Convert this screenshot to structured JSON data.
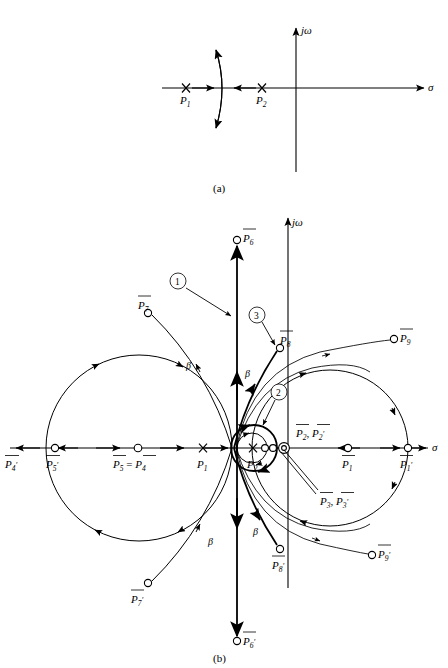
{
  "figure": {
    "panels": [
      {
        "id": "a",
        "caption": "(a)"
      },
      {
        "id": "b",
        "caption": "(b)"
      }
    ]
  },
  "axes": {
    "imaginary_label": "jω",
    "real_label": "σ"
  },
  "panel_a": {
    "caption": "(a)",
    "poles": [
      {
        "name": "P1",
        "label": "P",
        "subscript": "1",
        "marker": "cross",
        "x": -2.0
      },
      {
        "name": "P2",
        "label": "P",
        "subscript": "2",
        "marker": "cross",
        "x": -0.75
      }
    ],
    "breakaway_arc": {
      "description": "vertical breakaway arc between P1 and P2"
    },
    "axis_arrow_directions": [
      "right-toward-breakaway",
      "left-toward-breakaway"
    ]
  },
  "panel_b": {
    "caption": "(b)",
    "annotations": [
      {
        "id": "1",
        "label": "1",
        "points_to": "vertical-asymptote-branch"
      },
      {
        "id": "2",
        "label": "2",
        "points_to": "small-circle-near-origin"
      },
      {
        "id": "3",
        "label": "3",
        "points_to": "branch-to-P8bar"
      }
    ],
    "angle_labels": [
      {
        "label": "β",
        "position": "upper-left"
      },
      {
        "label": "β",
        "position": "upper-right"
      },
      {
        "label": "β",
        "position": "lower-left"
      },
      {
        "label": "β",
        "position": "lower-right"
      }
    ],
    "real_axis_poles": [
      {
        "name": "P1",
        "label": "P",
        "subscript": "1",
        "marker": "cross",
        "bar": false,
        "prime": false
      },
      {
        "name": "P2",
        "label": "P",
        "subscript": "2",
        "marker": "cross",
        "bar": false,
        "prime": false
      }
    ],
    "zeros": [
      {
        "name": "P4bar-prime",
        "label": "P",
        "subscript": "4",
        "bar": true,
        "prime": true,
        "location": "far-left-arrow"
      },
      {
        "name": "P5bar-prime",
        "label": "P",
        "subscript": "5",
        "bar": true,
        "prime": true,
        "location": "left-real-axis"
      },
      {
        "name": "P5bar-eq-P4bar",
        "label": "P₅ = P₄",
        "subscript": "",
        "bar": true,
        "prime": false,
        "location": "left-real-axis-mid",
        "text": "P5 = P4"
      },
      {
        "name": "P6bar",
        "label": "P",
        "subscript": "6",
        "bar": true,
        "prime": false,
        "location": "top-vertical"
      },
      {
        "name": "P6bar-prime",
        "label": "P",
        "subscript": "6",
        "bar": true,
        "prime": true,
        "location": "bottom-vertical"
      },
      {
        "name": "P7bar",
        "label": "P",
        "subscript": "7",
        "bar": true,
        "prime": false,
        "location": "upper-left"
      },
      {
        "name": "P7bar-prime",
        "label": "P",
        "subscript": "7",
        "bar": true,
        "prime": true,
        "location": "lower-left"
      },
      {
        "name": "P8bar",
        "label": "P",
        "subscript": "8",
        "bar": true,
        "prime": false,
        "location": "upper-center-right"
      },
      {
        "name": "P8bar-prime",
        "label": "P",
        "subscript": "8",
        "bar": true,
        "prime": true,
        "location": "lower-center-right"
      },
      {
        "name": "P9bar",
        "label": "P",
        "subscript": "9",
        "bar": true,
        "prime": false,
        "location": "upper-right"
      },
      {
        "name": "P9bar-prime",
        "label": "P",
        "subscript": "9",
        "bar": true,
        "prime": true,
        "location": "lower-right"
      },
      {
        "name": "P1bar",
        "label": "P",
        "subscript": "1",
        "bar": true,
        "prime": false,
        "location": "right-real-axis"
      },
      {
        "name": "P1bar-prime",
        "label": "P",
        "subscript": "1",
        "bar": true,
        "prime": true,
        "location": "far-right-real-axis"
      },
      {
        "name": "P2bar-P2bar-prime",
        "text": "P2 , P2'",
        "bar": true,
        "location": "double-zero-near-origin"
      },
      {
        "name": "P3bar-P3bar-prime",
        "text": "P3 , P3'",
        "bar": true,
        "location": "double-zero-near-origin-lower-lead"
      }
    ],
    "labels_text": {
      "p4_prime": "P",
      "p5_prime": "P",
      "p5_eq_p4_left": "P",
      "p5_eq_p4_eq": " = ",
      "p5_eq_p4_right": "P",
      "p1": "P",
      "p2": "P",
      "p1_bar": "P",
      "p1_bar_prime": "P",
      "p2_pair": "P",
      "p3_pair": "P",
      "p6": "P",
      "p6_prime": "P",
      "p7": "P",
      "p7_prime": "P",
      "p8": "P",
      "p8_prime": "P",
      "p9": "P",
      "p9_prime": "P",
      "beta": "β",
      "one": "1",
      "two": "2",
      "three": "3"
    },
    "subscripts": {
      "s1": "1",
      "s2": "2",
      "s3": "3",
      "s4": "4",
      "s5": "5",
      "s6": "6",
      "s7": "7",
      "s8": "8",
      "s9": "9"
    }
  }
}
